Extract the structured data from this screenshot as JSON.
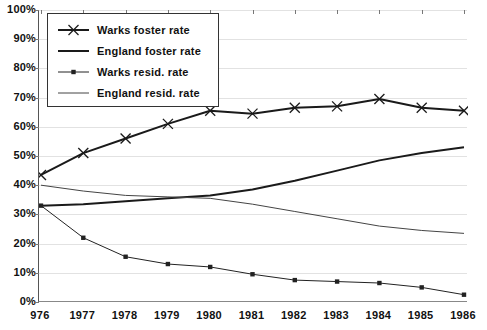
{
  "chart_data": {
    "type": "line",
    "title": "",
    "xlabel": "",
    "ylabel": "",
    "x": [
      "1976",
      "1977",
      "1978",
      "1979",
      "1980",
      "1981",
      "1982",
      "1983",
      "1984",
      "1985",
      "1986"
    ],
    "xtick_labels": [
      "976",
      "1977",
      "1978",
      "1979",
      "1980",
      "1981",
      "1982",
      "1983",
      "1984",
      "1985",
      "1986"
    ],
    "ytick_labels": [
      "100%",
      "90%",
      "80%",
      "70%",
      "60%",
      "50%",
      "40%",
      "30%",
      "20%",
      "10%",
      "0%"
    ],
    "ytick_values": [
      100,
      90,
      80,
      70,
      60,
      50,
      40,
      30,
      20,
      10,
      0
    ],
    "ylim": [
      0,
      100
    ],
    "grid": true,
    "legend_position": "upper-left-inside",
    "series": [
      {
        "name": "Warks foster rate",
        "marker": "x",
        "line": "thick",
        "color": "#1a1a1a",
        "values": [
          43.5,
          51.0,
          56.0,
          61.0,
          65.5,
          64.5,
          66.5,
          67.0,
          69.5,
          66.5,
          65.5
        ]
      },
      {
        "name": "England foster rate",
        "marker": "none",
        "line": "thick",
        "color": "#1a1a1a",
        "values": [
          33.0,
          33.5,
          34.5,
          35.5,
          36.5,
          38.5,
          41.5,
          45.0,
          48.5,
          51.0,
          53.0
        ]
      },
      {
        "name": "Warks resid. rate",
        "marker": "square",
        "line": "thin",
        "color": "#222222",
        "values": [
          33.0,
          22.0,
          15.5,
          13.0,
          12.0,
          9.5,
          7.5,
          7.0,
          6.5,
          5.0,
          2.5
        ]
      },
      {
        "name": "England resid. rate",
        "marker": "none",
        "line": "thin",
        "color": "#444444",
        "values": [
          40.0,
          38.0,
          36.5,
          36.0,
          35.5,
          33.5,
          31.0,
          28.5,
          26.0,
          24.5,
          23.5
        ]
      }
    ]
  },
  "legend": {
    "entries": [
      {
        "label": "Warks foster rate"
      },
      {
        "label": "England foster rate"
      },
      {
        "label": "Warks resid. rate"
      },
      {
        "label": "England resid. rate"
      }
    ]
  }
}
